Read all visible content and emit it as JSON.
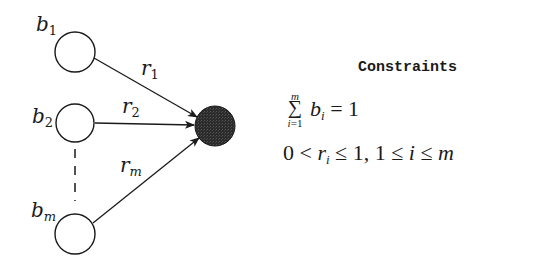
{
  "diagram": {
    "nodes": [
      {
        "id": "b1",
        "label": "b",
        "subscript": "1",
        "cx": 75,
        "cy": 52,
        "r": 20,
        "fill": "#ffffff"
      },
      {
        "id": "b2",
        "label": "b",
        "subscript": "2",
        "cx": 75,
        "cy": 123,
        "r": 20,
        "fill": "#ffffff"
      },
      {
        "id": "bm",
        "label": "b",
        "subscript": "m",
        "cx": 75,
        "cy": 233,
        "r": 20,
        "fill": "#ffffff"
      },
      {
        "id": "target",
        "label": "",
        "cx": 215,
        "cy": 126,
        "r": 20,
        "fill": "#2b2b2b"
      }
    ],
    "edges": [
      {
        "from": "b1",
        "to": "target",
        "label": "r",
        "subscript": "1"
      },
      {
        "from": "b2",
        "to": "target",
        "label": "r",
        "subscript": "2"
      },
      {
        "from": "bm",
        "to": "target",
        "label": "r",
        "subscript": "m"
      }
    ],
    "ellipsis": "dashed vertical line between b2 and bm"
  },
  "labels": {
    "b1": {
      "base": "b",
      "sub": "1"
    },
    "b2": {
      "base": "b",
      "sub": "2"
    },
    "bm": {
      "base": "b",
      "sub": "m"
    },
    "r1": {
      "base": "r",
      "sub": "1"
    },
    "r2": {
      "base": "r",
      "sub": "2"
    },
    "rm": {
      "base": "r",
      "sub": "m"
    }
  },
  "constraints": {
    "title": "Constraints",
    "eq1": {
      "sum_upper": "m",
      "sum_symbol": "∑",
      "sum_lower": "i=1",
      "var": "b",
      "var_sub": "i",
      "rhs": " = 1"
    },
    "eq2": {
      "p1": "0 < ",
      "var": "r",
      "var_sub": "i",
      "p2": " ≤ 1,  1 ≤ ",
      "idx": "i",
      "p3": " ≤ ",
      "m": "m"
    }
  },
  "colors": {
    "stroke": "#1a1a1a",
    "target_fill": "#2b2b2b",
    "background": "#ffffff"
  }
}
